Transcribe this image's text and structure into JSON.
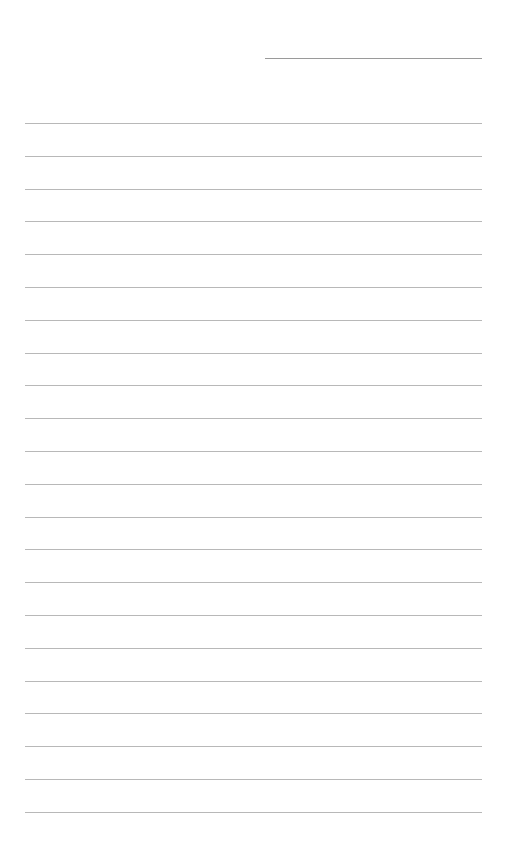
{
  "page": {
    "type": "blank lined paper",
    "header_line": {
      "label": ""
    },
    "ruled_line_count": 22,
    "line_color": "#b8b8b8",
    "lines": [
      "",
      "",
      "",
      "",
      "",
      "",
      "",
      "",
      "",
      "",
      "",
      "",
      "",
      "",
      "",
      "",
      "",
      "",
      "",
      "",
      "",
      ""
    ]
  }
}
